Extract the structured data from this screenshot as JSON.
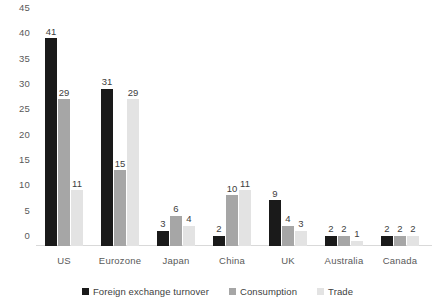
{
  "chart_data": {
    "type": "bar",
    "title": "",
    "subtitle": "",
    "xlabel": "",
    "ylabel": "",
    "ylim": [
      0,
      45
    ],
    "ytick_step": 5,
    "yticks": [
      "0",
      "5",
      "10",
      "15",
      "20",
      "25",
      "30",
      "35",
      "40",
      "45"
    ],
    "grid": false,
    "legend_position": "bottom",
    "categories": [
      "US",
      "Eurozone",
      "Japan",
      "China",
      "UK",
      "Australia",
      "Canada"
    ],
    "series": [
      {
        "name": "Foreign exchange turnover",
        "color": "#1a1a1a",
        "values": [
          41,
          31,
          3,
          2,
          9,
          2,
          2
        ]
      },
      {
        "name": "Consumption",
        "color": "#a6a6a6",
        "values": [
          29,
          15,
          6,
          10,
          4,
          2,
          2
        ]
      },
      {
        "name": "Trade",
        "color": "#e3e3e3",
        "values": [
          11,
          29,
          4,
          11,
          3,
          1,
          2
        ]
      }
    ]
  }
}
